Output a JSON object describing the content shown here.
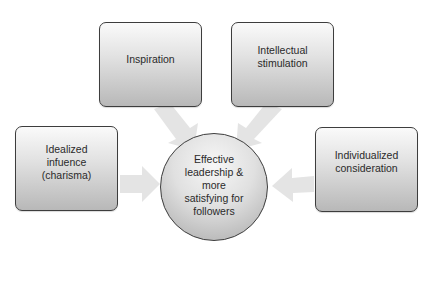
{
  "diagram": {
    "type": "hub-and-spoke",
    "center": {
      "label": "Effective\nleadership &\nmore\nsatisfying for\nfollowers"
    },
    "nodes": [
      {
        "id": "inspiration",
        "label": "Inspiration"
      },
      {
        "id": "intellectual-stimulation",
        "label": "Intellectual\nstimulation"
      },
      {
        "id": "idealized-influence",
        "label": "Idealized\ninfuence\n(charisma)"
      },
      {
        "id": "individualized-consideration",
        "label": "Individualized\nconsideration"
      }
    ],
    "edges": [
      {
        "from": "inspiration",
        "to": "center"
      },
      {
        "from": "intellectual-stimulation",
        "to": "center"
      },
      {
        "from": "idealized-influence",
        "to": "center"
      },
      {
        "from": "individualized-consideration",
        "to": "center"
      }
    ],
    "colors": {
      "arrow_fill": "#e4e4e4",
      "box_border": "#3d3d3d",
      "box_gradient_top": "#fafafa",
      "box_gradient_bottom": "#b8b8b8",
      "text": "#2a2a2a"
    }
  }
}
